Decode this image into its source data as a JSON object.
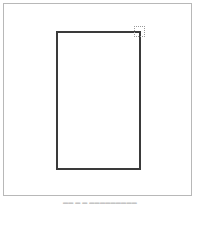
{
  "canvas": {
    "frame_border_color": "#b8b8b8",
    "background_color": "#ffffff"
  },
  "page_rect": {
    "border_color": "#3a3a3a",
    "fill_color": "#ffffff"
  },
  "resize_handle": {
    "icon": "dotted-resize-handle",
    "border_color": "#9a9a9a"
  },
  "caption": {
    "text": "▬▬  ▬ ▬ ▬▬▬▬▬▬▬▬▬"
  }
}
